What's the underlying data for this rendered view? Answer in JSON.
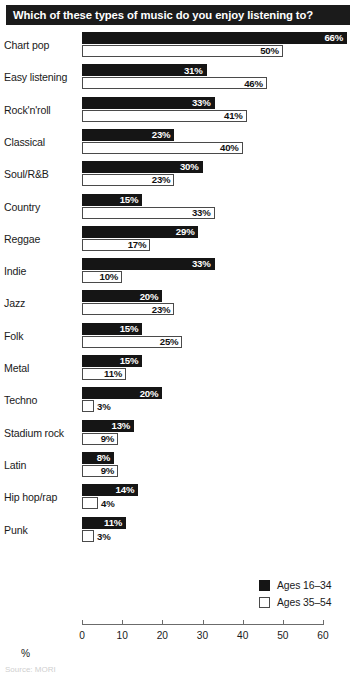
{
  "title": "Which of these types of music do you enjoy listening to?",
  "legend": {
    "items": [
      {
        "label": "Ages 16–34",
        "swatch": "dark"
      },
      {
        "label": "Ages 35–54",
        "swatch": "light"
      }
    ]
  },
  "axis": {
    "xlabel": "%",
    "ticks": [
      "0",
      "10",
      "20",
      "30",
      "40",
      "50",
      "60"
    ]
  },
  "footer": {
    "note": "Source: MORI"
  },
  "chart_data": {
    "type": "bar",
    "orientation": "horizontal",
    "title": "Which of these types of music do you enjoy listening to?",
    "xlabel": "%",
    "ylabel": "",
    "xlim": [
      0,
      60
    ],
    "xticks": [
      0,
      10,
      20,
      30,
      40,
      50,
      60
    ],
    "grid": false,
    "legend_position": "bottom-right",
    "categories": [
      "Chart pop",
      "Easy listening",
      "Rock'n'roll",
      "Classical",
      "Soul/R&B",
      "Country",
      "Reggae",
      "Indie",
      "Jazz",
      "Folk",
      "Metal",
      "Techno",
      "Stadium rock",
      "Latin",
      "Hip hop/rap",
      "Punk"
    ],
    "series": [
      {
        "name": "Ages 16–34",
        "color": "#151515",
        "values": [
          66,
          31,
          33,
          23,
          30,
          15,
          29,
          33,
          20,
          15,
          15,
          20,
          13,
          8,
          14,
          11
        ],
        "labels": [
          "66%",
          "31%",
          "33%",
          "23%",
          "30%",
          "15%",
          "29%",
          "33%",
          "20%",
          "15%",
          "15%",
          "20%",
          "13%",
          "8%",
          "14%",
          "11%"
        ]
      },
      {
        "name": "Ages 35–54",
        "color": "#ffffff",
        "values": [
          50,
          46,
          41,
          40,
          23,
          33,
          17,
          10,
          23,
          25,
          11,
          3,
          9,
          9,
          4,
          3
        ],
        "labels": [
          "50%",
          "46%",
          "41%",
          "40%",
          "23%",
          "33%",
          "17%",
          "10%",
          "23%",
          "25%",
          "11%",
          "3%",
          "9%",
          "9%",
          "4%",
          "3%"
        ]
      }
    ]
  }
}
